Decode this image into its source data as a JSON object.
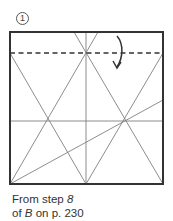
{
  "step": {
    "number": "1"
  },
  "diagram": {
    "square": {
      "x": 10,
      "y": 32,
      "width": 153,
      "height": 152
    },
    "fold_line": {
      "type": "valley",
      "y": 53,
      "style": "dashed"
    },
    "arrow": {
      "direction": "down",
      "style": "curved"
    },
    "colors": {
      "border": "#333333",
      "crease": "#808080",
      "dashed": "#333333",
      "arrow": "#333333"
    }
  },
  "caption": {
    "line1_prefix": "From step ",
    "line1_ref": "8",
    "line2_prefix": "of ",
    "line2_ref": "B",
    "line2_suffix": " on p. 230"
  }
}
